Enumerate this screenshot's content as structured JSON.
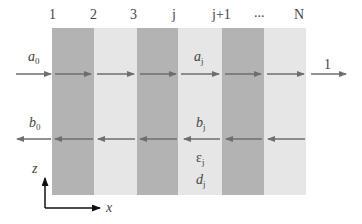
{
  "layers": [
    {
      "index_label": "1",
      "shade": "dark"
    },
    {
      "index_label": "2",
      "shade": "light"
    },
    {
      "index_label": "3",
      "shade": "dark"
    },
    {
      "index_label": "j",
      "shade": "light"
    },
    {
      "index_label": "j+1",
      "shade": "dark"
    },
    {
      "index_label": "...",
      "shade": "light"
    },
    {
      "index_label": "N",
      "shade": "light"
    }
  ],
  "labels": {
    "a0": {
      "base": "a",
      "sub": "0"
    },
    "aj": {
      "base": "a",
      "sub": "j"
    },
    "b0": {
      "base": "b",
      "sub": "0"
    },
    "bj": {
      "base": "b",
      "sub": "j"
    },
    "epsj": {
      "base": "ε",
      "sub": "j"
    },
    "dj": {
      "base": "d",
      "sub": "j"
    },
    "transmitted": "1",
    "axis_z": "z",
    "axis_x": "x"
  },
  "colors": {
    "dark_layer": "#b3b3b3",
    "light_layer": "#e6e6e6",
    "arrow": "#6e6e6e"
  }
}
